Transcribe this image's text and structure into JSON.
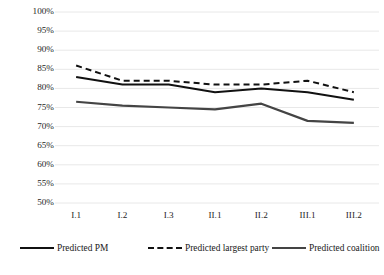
{
  "chart_data": {
    "type": "line",
    "title": "",
    "xlabel": "",
    "ylabel": "",
    "categories": [
      "I.1",
      "I.2",
      "I.3",
      "II.1",
      "II.2",
      "III.1",
      "III.2"
    ],
    "ylim": [
      50,
      100
    ],
    "ytick_values": [
      50,
      55,
      60,
      65,
      70,
      75,
      80,
      85,
      90,
      95,
      100
    ],
    "ytick_labels": [
      "50%",
      "55%",
      "60%",
      "65%",
      "70%",
      "75%",
      "80%",
      "85%",
      "90%",
      "95%",
      "100%"
    ],
    "grid": true,
    "legend_position": "bottom",
    "series": [
      {
        "name": "Predicted PM",
        "style": "solid",
        "color": "#111111",
        "values": [
          83,
          81,
          81,
          79,
          80,
          79,
          77
        ]
      },
      {
        "name": "Predicted largest party",
        "style": "dashed",
        "color": "#111111",
        "values": [
          86,
          82,
          82,
          81,
          81,
          82,
          79
        ]
      },
      {
        "name": "Predicted coalition",
        "style": "solid",
        "color": "#444444",
        "values": [
          76.5,
          75.5,
          75,
          74.5,
          76,
          71.5,
          71
        ]
      }
    ]
  },
  "legend": {
    "items": [
      {
        "label": "Predicted PM",
        "style": "solid",
        "color": "#111111"
      },
      {
        "label": "Predicted largest party",
        "style": "dashed",
        "color": "#111111"
      },
      {
        "label": "Predicted coalition",
        "style": "solid",
        "color": "#444444"
      }
    ]
  },
  "colors": {
    "gridline": "#e8e8e8",
    "axis_text": "#262626",
    "background": "#ffffff"
  }
}
